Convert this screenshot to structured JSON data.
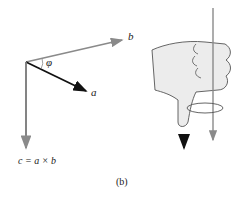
{
  "labels": {
    "b": "b",
    "a": "a",
    "phi": "φ",
    "c_eq": "c = a × b"
  },
  "caption": "(b)",
  "colors": {
    "gray_vector": "#8a8a8a",
    "black_vector": "#111111",
    "hand_fill": "#ececec",
    "hand_stroke": "#555555"
  }
}
